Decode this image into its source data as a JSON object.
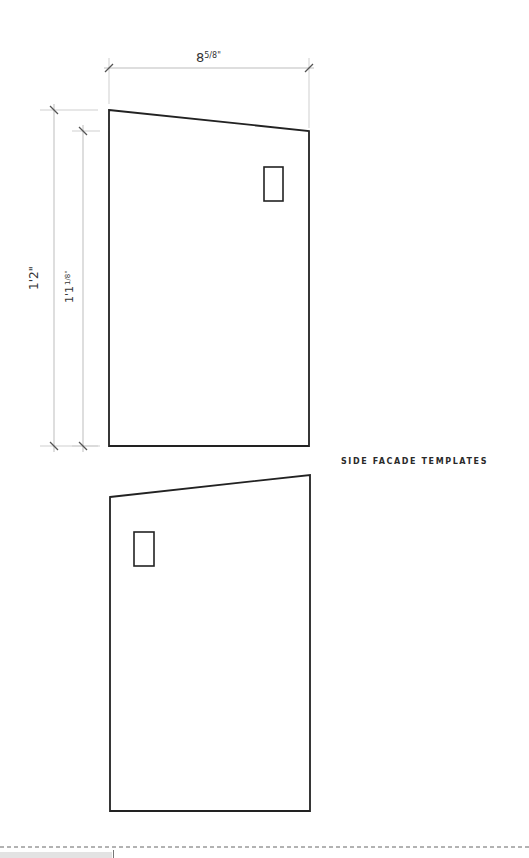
{
  "drawing": {
    "title": "SIDE FACADE TEMPLATES",
    "dimensions": {
      "width": {
        "whole": "8",
        "fraction": "5/8",
        "unit": "\""
      },
      "outer_height": {
        "label": "1'2\""
      },
      "inner_height": {
        "whole": "1'1",
        "fraction": "1/8",
        "unit": "\""
      }
    },
    "colors": {
      "outline": "#222222",
      "dimension_line": "#bdbdbd",
      "tick": "#555555",
      "cut_line": "#666666"
    },
    "templates": [
      {
        "name": "side-facade-upper",
        "slope": "high-left",
        "window": "top-right"
      },
      {
        "name": "side-facade-lower",
        "slope": "high-right",
        "window": "top-left"
      }
    ]
  }
}
